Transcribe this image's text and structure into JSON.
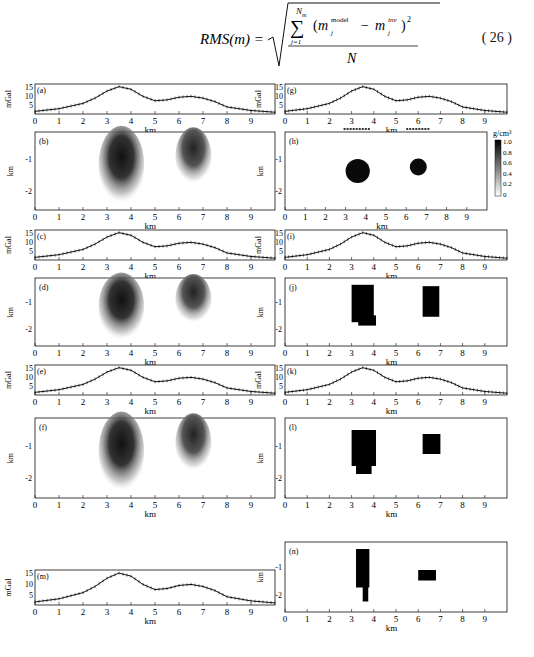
{
  "equation": {
    "lhs": "RMS(m) =",
    "sum_top": "N",
    "sum_top_sub": "m",
    "sum_bottom": "j=1",
    "term_model": "m",
    "term_model_sup": "model",
    "term_inv": "m",
    "term_inv_sup": "inv",
    "sub_j": "j",
    "power": "2",
    "denominator": "N",
    "number": "( 26 )"
  },
  "labels": {
    "mgal": "mGal",
    "km": "km",
    "colorbar_unit": "g/cm³"
  },
  "x_ticks": [
    "0",
    "1",
    "2",
    "3",
    "4",
    "5",
    "6",
    "7",
    "8",
    "9"
  ],
  "gravity_y_ticks": [
    "15",
    "10",
    "5"
  ],
  "depth_y_ticks": [
    "-1",
    "-2"
  ],
  "colorbar_ticks": [
    "1.0",
    "0.8",
    "0.6",
    "0.4",
    "0.2",
    "0"
  ],
  "panels": {
    "a": "(a)",
    "b": "(b)",
    "c": "(c)",
    "d": "(d)",
    "e": "(e)",
    "f": "(f)",
    "m": "(m)",
    "g": "(g)",
    "h": "(h)",
    "i": "(i)",
    "j": "(j)",
    "k": "(k)",
    "l": "(l)",
    "n": "(n)"
  },
  "chart_data": [
    {
      "panel": "a",
      "type": "line",
      "ylabel": "mGal",
      "xlabel": "km",
      "xlim": [
        0,
        10
      ],
      "ylim": [
        0,
        17
      ],
      "x": [
        0,
        1,
        2,
        2.5,
        3,
        3.5,
        4,
        4.5,
        5,
        5.5,
        6,
        6.5,
        7,
        7.5,
        8,
        9,
        10
      ],
      "values": [
        1.5,
        3,
        6,
        9,
        13,
        15.5,
        14,
        10,
        7.5,
        8,
        9.5,
        10,
        9,
        7,
        4,
        2,
        1
      ]
    },
    {
      "panel": "c",
      "type": "line",
      "ylabel": "mGal",
      "xlabel": "km",
      "xlim": [
        0,
        10
      ],
      "ylim": [
        0,
        17
      ],
      "x": [
        0,
        1,
        2,
        2.5,
        3,
        3.5,
        4,
        4.5,
        5,
        5.5,
        6,
        6.5,
        7,
        7.5,
        8,
        9,
        10
      ],
      "values": [
        1.5,
        3,
        6,
        9,
        13,
        15.5,
        14,
        10,
        7.5,
        8,
        9.5,
        10,
        9,
        7,
        4,
        2,
        1
      ]
    },
    {
      "panel": "e",
      "type": "line",
      "ylabel": "mGal",
      "xlabel": "km",
      "xlim": [
        0,
        10
      ],
      "ylim": [
        0,
        17
      ],
      "x": [
        0,
        1,
        2,
        2.5,
        3,
        3.5,
        4,
        4.5,
        5,
        5.5,
        6,
        6.5,
        7,
        7.5,
        8,
        9,
        10
      ],
      "values": [
        1.5,
        3,
        6,
        9,
        13,
        15.5,
        14,
        10,
        7.5,
        8,
        9.5,
        10,
        9,
        7,
        4,
        2,
        1
      ]
    },
    {
      "panel": "m",
      "type": "line",
      "ylabel": "mGal",
      "xlabel": "km",
      "xlim": [
        0,
        10
      ],
      "ylim": [
        0,
        17
      ],
      "x": [
        0,
        1,
        2,
        2.5,
        3,
        3.5,
        4,
        4.5,
        5,
        5.5,
        6,
        6.5,
        7,
        7.5,
        8,
        9,
        10
      ],
      "values": [
        1.5,
        3,
        6,
        9,
        13,
        15.5,
        14,
        10,
        7.5,
        8,
        9.5,
        10,
        9,
        7,
        4,
        2,
        1
      ]
    },
    {
      "panel": "g",
      "type": "line",
      "ylabel": "mGal",
      "xlabel": "km",
      "xlim": [
        0,
        10
      ],
      "ylim": [
        0,
        17
      ],
      "x": [
        0,
        1,
        2,
        2.5,
        3,
        3.5,
        4,
        4.5,
        5,
        5.5,
        6,
        6.5,
        7,
        7.5,
        8,
        9,
        10
      ],
      "values": [
        1.5,
        3,
        6,
        9,
        13,
        15.5,
        14,
        10,
        7.5,
        8,
        9.5,
        10,
        9,
        7,
        4,
        2,
        1
      ]
    },
    {
      "panel": "i",
      "type": "line",
      "ylabel": "mGal",
      "xlabel": "km",
      "xlim": [
        0,
        10
      ],
      "ylim": [
        0,
        17
      ],
      "x": [
        0,
        1,
        2,
        2.5,
        3,
        3.5,
        4,
        4.5,
        5,
        5.5,
        6,
        6.5,
        7,
        7.5,
        8,
        9,
        10
      ],
      "values": [
        1.5,
        3,
        6,
        9,
        13,
        15.5,
        14,
        10,
        7.5,
        8,
        9.5,
        10,
        9,
        7,
        4,
        2,
        1
      ]
    },
    {
      "panel": "k",
      "type": "line",
      "ylabel": "mGal",
      "xlabel": "km",
      "xlim": [
        0,
        10
      ],
      "ylim": [
        0,
        17
      ],
      "x": [
        0,
        1,
        2,
        2.5,
        3,
        3.5,
        4,
        4.5,
        5,
        5.5,
        6,
        6.5,
        7,
        7.5,
        8,
        9,
        10
      ],
      "values": [
        1.5,
        3,
        6,
        9,
        13,
        15.5,
        14,
        10,
        7.5,
        8,
        9.5,
        10,
        9,
        7,
        4,
        2,
        1
      ]
    },
    {
      "panel": "b",
      "type": "heatmap",
      "xlabel": "km",
      "ylabel": "km",
      "xlim": [
        0,
        10
      ],
      "ylim": [
        -2.5,
        0
      ],
      "bodies": [
        {
          "cx": 3.6,
          "cy": -1.0,
          "w": 1.8,
          "h": 1.6
        },
        {
          "cx": 6.6,
          "cy": -0.8,
          "w": 1.4,
          "h": 1.0
        }
      ]
    },
    {
      "panel": "d",
      "type": "heatmap",
      "xlabel": "km",
      "ylabel": "km",
      "xlim": [
        0,
        10
      ],
      "ylim": [
        -2.5,
        0
      ],
      "bodies": [
        {
          "cx": 3.6,
          "cy": -1.0,
          "w": 1.8,
          "h": 1.6
        },
        {
          "cx": 6.6,
          "cy": -0.8,
          "w": 1.4,
          "h": 1.0
        }
      ]
    },
    {
      "panel": "f",
      "type": "heatmap",
      "xlabel": "km",
      "ylabel": "km",
      "xlim": [
        0,
        10
      ],
      "ylim": [
        -2.5,
        0
      ],
      "bodies": [
        {
          "cx": 3.6,
          "cy": -1.0,
          "w": 1.8,
          "h": 1.6
        },
        {
          "cx": 6.6,
          "cy": -0.8,
          "w": 1.4,
          "h": 1.0
        }
      ]
    },
    {
      "panel": "h",
      "type": "heatmap",
      "xlabel": "km",
      "ylabel": "km",
      "xlim": [
        0,
        10
      ],
      "ylim": [
        -2.5,
        0
      ],
      "colorbar": [
        0,
        1.0
      ],
      "bodies": [
        {
          "cx": 3.6,
          "cy": -1.2,
          "r": 0.6
        },
        {
          "cx": 6.6,
          "cy": -1.0,
          "r": 0.4
        }
      ]
    },
    {
      "panel": "j",
      "type": "heatmap",
      "xlabel": "km",
      "ylabel": "km",
      "xlim": [
        0,
        10
      ],
      "ylim": [
        -2.5,
        0
      ],
      "bodies": [
        {
          "cx": 3.6,
          "cy": -1.0
        },
        {
          "cx": 6.6,
          "cy": -1.0
        }
      ]
    },
    {
      "panel": "l",
      "type": "heatmap",
      "xlabel": "km",
      "ylabel": "km",
      "xlim": [
        0,
        10
      ],
      "ylim": [
        -2.5,
        0
      ],
      "bodies": [
        {
          "cx": 3.6,
          "cy": -1.0
        },
        {
          "cx": 6.6,
          "cy": -0.8
        }
      ]
    },
    {
      "panel": "n",
      "type": "heatmap",
      "xlabel": "km",
      "ylabel": "km",
      "xlim": [
        0,
        10
      ],
      "ylim": [
        -2.5,
        0
      ],
      "bodies": [
        {
          "cx": 3.5,
          "cy": -1.2
        },
        {
          "cx": 6.5,
          "cy": -0.8
        }
      ]
    }
  ]
}
